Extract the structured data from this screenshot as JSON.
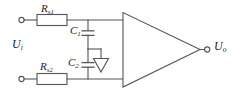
{
  "diagram": {
    "type": "electronic-circuit-schematic",
    "colors": {
      "background": "#ffffff",
      "wire": "#55555a",
      "text": "#1d1d1f"
    },
    "labels": {
      "input_voltage": "U",
      "input_voltage_sub": "i",
      "output_voltage": "U",
      "output_voltage_sub": "o",
      "resistor_top": "R",
      "resistor_top_sub": "s1",
      "resistor_bottom": "R",
      "resistor_bottom_sub": "s2",
      "capacitor_top": "C",
      "capacitor_top_sub": "1",
      "capacitor_bottom": "C",
      "capacitor_bottom_sub": "2"
    },
    "components": [
      {
        "id": "terminal-input-top",
        "kind": "terminal-node",
        "shape": "open-circle"
      },
      {
        "id": "terminal-input-bottom",
        "kind": "terminal-node",
        "shape": "open-circle"
      },
      {
        "id": "terminal-output",
        "kind": "terminal-node",
        "shape": "open-circle"
      },
      {
        "id": "resistor-rs1",
        "kind": "resistor",
        "shape": "rectangle-box",
        "label": "Rs1"
      },
      {
        "id": "resistor-rs2",
        "kind": "resistor",
        "shape": "rectangle-box",
        "label": "Rs2"
      },
      {
        "id": "capacitor-c1",
        "kind": "capacitor",
        "shape": "parallel-plates",
        "label": "C1"
      },
      {
        "id": "capacitor-c2",
        "kind": "capacitor",
        "shape": "parallel-plates",
        "label": "C2"
      },
      {
        "id": "ground-symbol",
        "kind": "ground",
        "shape": "open-triangle"
      },
      {
        "id": "opamp",
        "kind": "operational-amplifier",
        "shape": "triangle"
      }
    ]
  }
}
